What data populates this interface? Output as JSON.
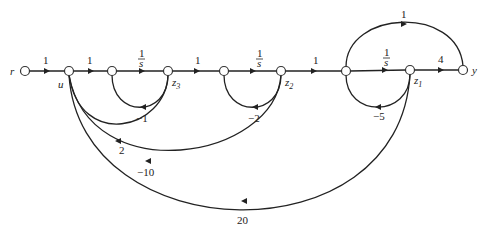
{
  "nodes": {
    "r": "r",
    "u": "u",
    "z3": "z",
    "z3_sub": "3",
    "z2": "z",
    "z2_sub": "2",
    "z1": "z",
    "z1_sub": "1",
    "y": "y"
  },
  "edges": {
    "r_u": "1",
    "u_n2": "1",
    "n2_z3_num": "1",
    "n2_z3_den": "s",
    "z3_n4": "1",
    "n4_z2_num": "1",
    "n4_z2_den": "s",
    "z2_n6": "1",
    "n6_z1_num": "1",
    "n6_z1_den": "s",
    "z1_y": "4",
    "n6_y": "1",
    "z3_n2_fb": "−1",
    "z2_n4_fb": "−2",
    "z1_n6_fb": "−5",
    "z3_u": "2",
    "z2_u": "−10",
    "z1_u": "20"
  }
}
